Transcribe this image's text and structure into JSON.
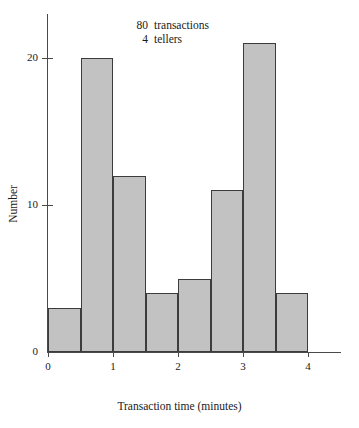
{
  "chart_data": {
    "type": "bar",
    "title": "",
    "xlabel": "Transaction time (minutes)",
    "ylabel": "Number",
    "categories": [
      "0.0-0.5",
      "0.5-1.0",
      "1.0-1.5",
      "1.5-2.0",
      "2.0-2.5",
      "2.5-3.0",
      "3.0-3.5",
      "3.5-4.0"
    ],
    "bin_edges": [
      0,
      0.5,
      1,
      1.5,
      2,
      2.5,
      3,
      3.5,
      4
    ],
    "values": [
      3,
      20,
      12,
      4,
      5,
      11,
      21,
      4
    ],
    "xlim": [
      0,
      4
    ],
    "ylim": [
      0,
      23
    ],
    "xticks": [
      "0",
      "1",
      "2",
      "3",
      "4"
    ],
    "xtick_values": [
      0,
      1,
      2,
      3,
      4
    ],
    "yticks": [
      "0",
      "10",
      "20"
    ],
    "ytick_values": [
      0,
      10,
      20
    ],
    "grid": false,
    "legend": null,
    "bar_fill_color": "#c2c2c2",
    "bar_edge_color": "#3c3c3c",
    "axis_color": "#4a4a4a"
  },
  "annotation": {
    "line1_value": "80",
    "line1_text": "transactions",
    "line2_value": "4",
    "line2_text": "tellers"
  },
  "title_remnant": ""
}
